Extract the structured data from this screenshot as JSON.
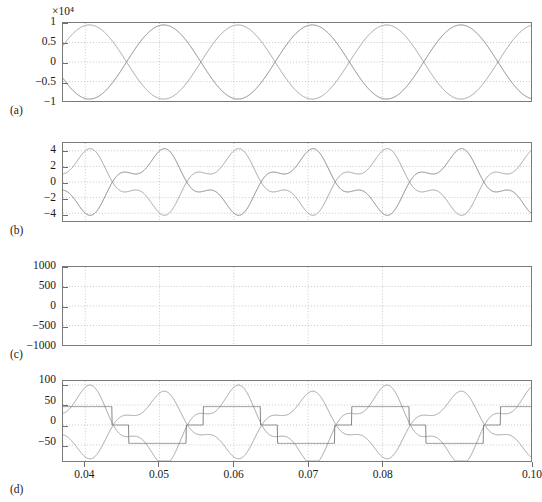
{
  "figure": {
    "background": "#ffffff",
    "trace_color": "#9a9a9a",
    "trace_color_dark": "#7d7d7d",
    "axis_color": "#7a7a7a",
    "grid_color": "#b9b9b9",
    "x_range": [
      0.037,
      0.1
    ],
    "x_ticks": [
      0.04,
      0.05,
      0.06,
      0.07,
      0.08,
      0.1
    ],
    "x_tick_labels": [
      "0.04",
      "0.05",
      "0.06",
      "0.07",
      "0.08",
      "0.10"
    ]
  },
  "chart_data": [
    {
      "type": "line",
      "panel": "a",
      "label": "(a)",
      "title": "",
      "xlabel": "",
      "ylabel": "",
      "y_exponent_label": "×10⁴",
      "y_scale": 10000,
      "ylim": [
        -1,
        1
      ],
      "y_ticks": [
        1,
        0.5,
        0,
        -0.5,
        -1
      ],
      "y_tick_labels": [
        "1",
        "0.5",
        "0",
        "−0.5",
        "−1"
      ],
      "xlim": [
        0.037,
        0.1
      ],
      "grid": true,
      "series": [
        {
          "name": "waveform-1",
          "kind": "sine",
          "amplitude": 0.95,
          "frequency_hz": 50,
          "phase_deg": 80,
          "offset": 0
        },
        {
          "name": "waveform-2",
          "kind": "sine",
          "amplitude": 0.95,
          "frequency_hz": 50,
          "phase_deg": 260,
          "offset": 0
        }
      ]
    },
    {
      "type": "line",
      "panel": "b",
      "label": "(b)",
      "title": "",
      "xlabel": "",
      "ylabel": "",
      "ylim": [
        -5,
        5
      ],
      "y_ticks": [
        4,
        2,
        0,
        -2,
        -4
      ],
      "y_tick_labels": [
        "4",
        "2",
        "0",
        "−2",
        "−4"
      ],
      "xlim": [
        0.037,
        0.1
      ],
      "grid": true,
      "series": [
        {
          "name": "waveform-1",
          "kind": "modulated",
          "amplitude": 3.2,
          "frequency_hz": 50,
          "phase_deg": 95,
          "harmonic_amp": 1.25,
          "harmonic_mult": 3,
          "harmonic_phase_deg": 40
        },
        {
          "name": "waveform-2",
          "kind": "modulated",
          "amplitude": 3.2,
          "frequency_hz": 50,
          "phase_deg": 275,
          "harmonic_amp": 1.25,
          "harmonic_mult": 3,
          "harmonic_phase_deg": 220
        }
      ]
    },
    {
      "type": "line",
      "panel": "c",
      "label": "(c)",
      "title": "",
      "xlabel": "",
      "ylabel": "",
      "ylim": [
        -1000,
        1000
      ],
      "y_ticks": [
        1000,
        500,
        0,
        -500,
        -1000
      ],
      "y_tick_labels": [
        "1000",
        "500",
        "0",
        "−500",
        "−1000"
      ],
      "xlim": [
        0.037,
        0.1
      ],
      "grid": true,
      "series": [
        {
          "name": "ripple-upper",
          "kind": "pwm-ripple",
          "envelope_amplitude": 330,
          "envelope_frequency_hz": 50,
          "envelope_phase_deg": 95,
          "ripple_amplitude": 200,
          "ripple_frequency_hz": 1600
        },
        {
          "name": "ripple-lower",
          "kind": "pwm-ripple",
          "envelope_amplitude": 330,
          "envelope_frequency_hz": 50,
          "envelope_phase_deg": 275,
          "ripple_amplitude": 200,
          "ripple_frequency_hz": 1600
        }
      ]
    },
    {
      "type": "line",
      "panel": "d",
      "label": "(d)",
      "title": "",
      "xlabel": "",
      "ylabel": "",
      "ylim": [
        -90,
        110
      ],
      "y_ticks": [
        100,
        50,
        0,
        -50
      ],
      "y_tick_labels": [
        "100",
        "50",
        "0",
        "−50"
      ],
      "xlim": [
        0.037,
        0.1
      ],
      "grid": true,
      "series": [
        {
          "name": "smooth-wave",
          "kind": "modulated",
          "amplitude": 78,
          "frequency_hz": 50,
          "phase_deg": 95,
          "harmonic_amp": 26,
          "harmonic_mult": 3,
          "harmonic_phase_deg": 40
        },
        {
          "name": "stepped-wave",
          "kind": "staircase",
          "high_level": 46,
          "low_level": -46,
          "zero_level": 0,
          "frequency_hz": 50,
          "phase_deg": 95
        },
        {
          "name": "lower-wave",
          "kind": "modulated",
          "amplitude": 66,
          "frequency_hz": 50,
          "phase_deg": 275,
          "harmonic_amp": 22,
          "harmonic_mult": 3,
          "harmonic_phase_deg": 220
        }
      ]
    }
  ]
}
